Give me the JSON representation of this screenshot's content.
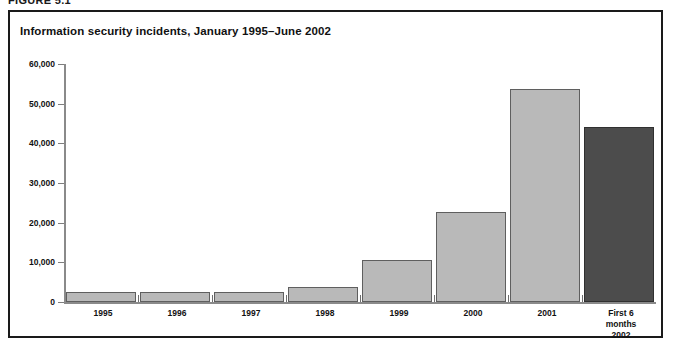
{
  "figure": {
    "caption_cropped": "FIGURE 5.1",
    "title": "Information security incidents, January 1995–June 2002"
  },
  "chart_data": {
    "type": "bar",
    "title": "Information security incidents, January 1995–June 2002",
    "xlabel": "",
    "ylabel": "",
    "categories": [
      "1995",
      "1996",
      "1997",
      "1998",
      "1999",
      "2000",
      "2001",
      "First 6\nmonths\n2002"
    ],
    "category_labels": [
      {
        "lines": [
          "1995"
        ]
      },
      {
        "lines": [
          "1996"
        ]
      },
      {
        "lines": [
          "1997"
        ]
      },
      {
        "lines": [
          "1998"
        ]
      },
      {
        "lines": [
          "1999"
        ]
      },
      {
        "lines": [
          "2000"
        ]
      },
      {
        "lines": [
          "2001"
        ]
      },
      {
        "lines": [
          "First 6",
          "months",
          "2002"
        ]
      }
    ],
    "values": [
      2400,
      2600,
      2400,
      3900,
      10600,
      22700,
      53600,
      44000
    ],
    "bar_colors": [
      "#b9b9b9",
      "#b9b9b9",
      "#b9b9b9",
      "#b9b9b9",
      "#b9b9b9",
      "#b9b9b9",
      "#b9b9b9",
      "#4c4c4c"
    ],
    "highlight_index": 7,
    "ylim": [
      0,
      60000
    ],
    "ytick_values": [
      0,
      10000,
      20000,
      30000,
      40000,
      50000,
      60000
    ],
    "ytick_labels": [
      "0",
      "10,000",
      "20,000",
      "30,000",
      "40,000",
      "50,000",
      "60,000"
    ],
    "grid": false,
    "legend": null
  },
  "colors": {
    "bar_light": "#b9b9b9",
    "bar_dark": "#4c4c4c",
    "bar_outline": "#5f5f5f",
    "axis": "#8a8a8a",
    "frame": "#1a1a1a",
    "text": "#111111",
    "background": "#ffffff"
  }
}
